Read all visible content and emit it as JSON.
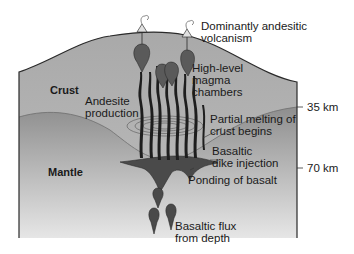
{
  "diagram": {
    "type": "geologic-cross-section",
    "regions": {
      "crust": "Crust",
      "mantle": "Mantle"
    },
    "labels": {
      "volcanism_line1": "Dominantly andesitic",
      "volcanism_line2": "volcanism",
      "chambers_line1": "High-level",
      "chambers_line2": "magma",
      "chambers_line3": "chambers",
      "andesite_line1": "Andesite",
      "andesite_line2": "production",
      "melting_line1": "Partial melting of",
      "melting_line2": "crust begins",
      "dike_line1": "Basaltic",
      "dike_line2": "dike injection",
      "ponding": "Ponding of basalt",
      "flux_line1": "Basaltic flux",
      "flux_line2": "from depth"
    },
    "depth_markers": [
      {
        "label": "35 km"
      },
      {
        "label": "70 km"
      }
    ],
    "colors": {
      "crust_fill": "#b5b5b5",
      "mantle_fill": "#9c9c9c",
      "basalt": "#4a4a4a",
      "magma": "#1e1e1e",
      "outline": "#2a2a2a"
    }
  }
}
